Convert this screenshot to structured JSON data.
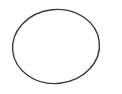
{
  "image": {
    "subject": "o-ring",
    "description": "Thin black rubber O-ring viewed at a slight angle on a white background",
    "background_color": "#ffffff",
    "ring_color": "#3a3a3a"
  }
}
